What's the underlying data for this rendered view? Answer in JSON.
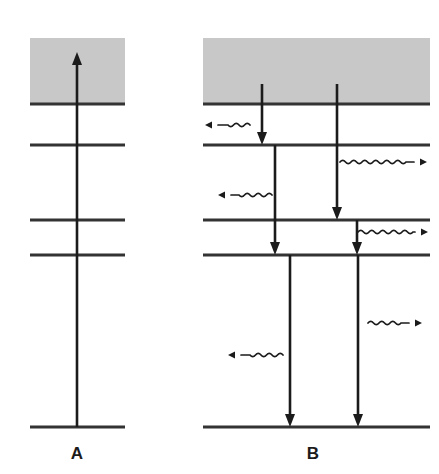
{
  "figure": {
    "title": "",
    "background_color": "#ffffff",
    "width": 439,
    "height": 474,
    "line_color": "#333333",
    "arrow_color": "#1b1b1b",
    "band_color": "#c8c8c8"
  },
  "panels": [
    {
      "id": "A",
      "label": "A",
      "label_x": 77,
      "label_y": 459,
      "description": "absorption: single upward arrow from ground state into continuum band",
      "left": 30,
      "right": 125,
      "band": {
        "name": "continuum-band",
        "x": 30,
        "y": 38,
        "width": 95,
        "height": 66
      },
      "levels": [
        {
          "name": "band-edge-level",
          "y": 104
        },
        {
          "name": "level-2",
          "y": 145
        },
        {
          "name": "level-3",
          "y": 220
        },
        {
          "name": "level-4",
          "y": 255
        },
        {
          "name": "ground-level",
          "y": 427
        }
      ],
      "straight_arrows": [
        {
          "name": "absorption-arrow",
          "x": 77,
          "y1": 427,
          "y2": 52,
          "direction": "up"
        }
      ],
      "wavy_arrows": []
    },
    {
      "id": "B",
      "label": "B",
      "label_x": 313,
      "label_y": 459,
      "description": "emission cascade: downward radiative transitions with wavy photon arrows",
      "left": 203,
      "right": 430,
      "band": {
        "name": "continuum-band",
        "x": 203,
        "y": 38,
        "width": 227,
        "height": 66
      },
      "levels": [
        {
          "name": "band-edge-level",
          "y": 104
        },
        {
          "name": "level-2",
          "y": 145
        },
        {
          "name": "level-3",
          "y": 220
        },
        {
          "name": "level-4",
          "y": 255
        },
        {
          "name": "ground-level",
          "y": 427
        }
      ],
      "straight_arrows": [
        {
          "name": "decay-arrow-band-to-level2",
          "x": 262,
          "y1": 84,
          "y2": 145,
          "direction": "down"
        },
        {
          "name": "decay-arrow-band-to-level3",
          "x": 337,
          "y1": 84,
          "y2": 220,
          "direction": "down"
        },
        {
          "name": "decay-arrow-level2-to-level4",
          "x": 275,
          "y1": 145,
          "y2": 255,
          "direction": "down"
        },
        {
          "name": "decay-arrow-level3-to-level4",
          "x": 357,
          "y1": 220,
          "y2": 255,
          "direction": "down"
        },
        {
          "name": "decay-arrow-level4-to-ground-left",
          "x": 290,
          "y1": 255,
          "y2": 427,
          "direction": "down"
        },
        {
          "name": "decay-arrow-level4-to-ground-right",
          "x": 358,
          "y1": 255,
          "y2": 427,
          "direction": "down"
        }
      ],
      "wavy_arrows": [
        {
          "name": "photon-wave-left-upper",
          "y": 125,
          "x1": 250,
          "x2": 205,
          "direction": "left"
        },
        {
          "name": "photon-wave-right-upper",
          "y": 162,
          "x1": 340,
          "x2": 427,
          "direction": "right"
        },
        {
          "name": "photon-wave-left-middle",
          "y": 195,
          "x1": 272,
          "x2": 218,
          "direction": "left"
        },
        {
          "name": "photon-wave-right-middle",
          "y": 232,
          "x1": 358,
          "x2": 428,
          "direction": "right"
        },
        {
          "name": "photon-wave-right-lower",
          "y": 323,
          "x1": 368,
          "x2": 422,
          "direction": "right"
        },
        {
          "name": "photon-wave-left-lower",
          "y": 355,
          "x1": 283,
          "x2": 228,
          "direction": "left"
        }
      ]
    }
  ]
}
